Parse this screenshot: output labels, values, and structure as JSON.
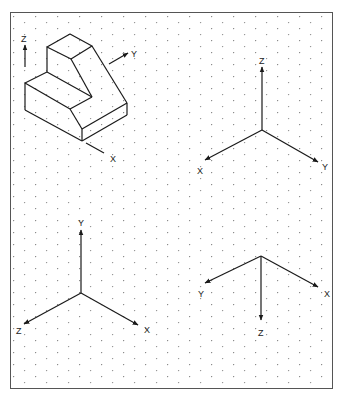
{
  "colors": {
    "line": "#1a1a1a",
    "dot": "#8a8a8a",
    "frame": "#555555",
    "background": "#ffffff"
  },
  "frame": {
    "x": 10,
    "y": 12,
    "width": 323,
    "height": 377
  },
  "grid": {
    "type": "isometric-dots",
    "col_spacing": 11,
    "row_spacing": 12
  },
  "panels": [
    {
      "id": "object-view",
      "description": "Isometric L-shaped block with orientation axes",
      "axes": {
        "z": {
          "label": "Z"
        },
        "y": {
          "label": "Y"
        },
        "x": {
          "label": "X"
        }
      }
    },
    {
      "id": "axes-top-right",
      "axes": {
        "z": {
          "label": "Z",
          "direction": "up"
        },
        "x": {
          "label": "X",
          "direction": "down-left"
        },
        "y": {
          "label": "Y",
          "direction": "down-right"
        }
      }
    },
    {
      "id": "axes-bottom-left",
      "axes": {
        "y": {
          "label": "Y",
          "direction": "up"
        },
        "z": {
          "label": "Z",
          "direction": "down-left"
        },
        "x": {
          "label": "X",
          "direction": "down-right"
        }
      }
    },
    {
      "id": "axes-bottom-right",
      "axes": {
        "y": {
          "label": "Y",
          "direction": "down-left"
        },
        "x": {
          "label": "X",
          "direction": "down-right"
        },
        "z": {
          "label": "Z",
          "direction": "down"
        }
      }
    }
  ]
}
